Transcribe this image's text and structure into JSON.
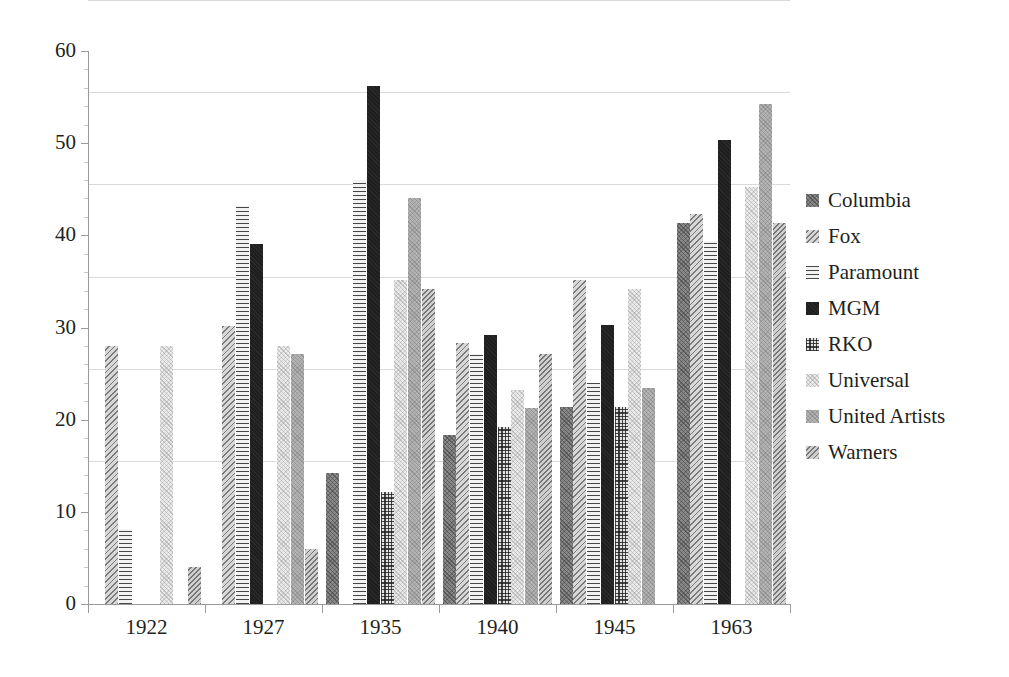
{
  "chart_data": {
    "type": "bar",
    "title": "",
    "xlabel": "",
    "ylabel": "",
    "ylim": [
      0,
      60
    ],
    "yticks": [
      0,
      10,
      20,
      30,
      40,
      50,
      60
    ],
    "grid": true,
    "legend_position": "right",
    "categories": [
      "1922",
      "1927",
      "1935",
      "1940",
      "1945",
      "1963"
    ],
    "series": [
      {
        "name": "Columbia",
        "pattern": "dark-diagonal-crosshatch",
        "color": "#8a8a8a",
        "values": [
          null,
          null,
          14.2,
          18.3,
          21.4,
          41.3
        ]
      },
      {
        "name": "Fox",
        "pattern": "light-diagonal-hatch",
        "color": "#d8d8d8",
        "values": [
          28.0,
          30.2,
          null,
          28.3,
          35.2,
          42.3
        ]
      },
      {
        "name": "Paramount",
        "pattern": "horizontal-lines",
        "color": "#f2f2f2",
        "values": [
          8.1,
          43.2,
          46.0,
          27.1,
          24.0,
          39.4
        ]
      },
      {
        "name": "MGM",
        "pattern": "solid-black",
        "color": "#1f1f1f",
        "values": [
          null,
          39.1,
          56.2,
          29.2,
          30.3,
          50.3
        ]
      },
      {
        "name": "RKO",
        "pattern": "grid-crosshatch",
        "color": "#e3e3e3",
        "values": [
          null,
          null,
          12.2,
          19.2,
          21.4,
          null
        ]
      },
      {
        "name": "Universal",
        "pattern": "very-light-crosshatch",
        "color": "#ebebeb",
        "values": [
          28.0,
          28.0,
          35.2,
          23.2,
          34.2,
          45.3
        ]
      },
      {
        "name": "United Artists",
        "pattern": "medium-grey-crosshatch",
        "color": "#b4b4b4",
        "values": [
          null,
          27.1,
          44.1,
          21.3,
          23.4,
          54.2
        ]
      },
      {
        "name": "Warners",
        "pattern": "grey-diagonal-hatch",
        "color": "#cfcfcf",
        "values": [
          4.0,
          6.0,
          34.2,
          27.1,
          null,
          41.3
        ]
      }
    ]
  },
  "axis": {
    "y_tick_labels": [
      "0",
      "10",
      "20",
      "30",
      "40",
      "50",
      "60"
    ],
    "x_tick_labels": [
      "1922",
      "1927",
      "1935",
      "1940",
      "1945",
      "1963"
    ]
  },
  "legend": {
    "items": [
      {
        "label": "Columbia"
      },
      {
        "label": "Fox"
      },
      {
        "label": "Paramount"
      },
      {
        "label": "MGM"
      },
      {
        "label": "RKO"
      },
      {
        "label": "Universal"
      },
      {
        "label": "United Artists"
      },
      {
        "label": "Warners"
      }
    ]
  }
}
